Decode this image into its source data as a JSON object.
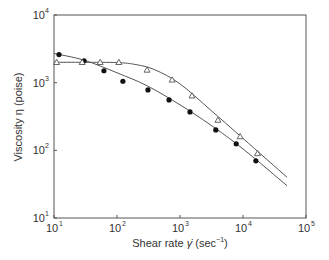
{
  "chart_data": {
    "type": "scatter",
    "title": "",
    "xlabel": "Shear rate γ̇ (sec⁻¹)",
    "ylabel": "Viscosity η (poise)",
    "xscale": "log",
    "yscale": "log",
    "xlim": [
      10,
      100000
    ],
    "ylim": [
      10,
      10000
    ],
    "x_ticks": [
      "10^1",
      "10^2",
      "10^3",
      "10^4",
      "10^5"
    ],
    "y_ticks": [
      "10^1",
      "10^2",
      "10^3",
      "10^4"
    ],
    "grid": false,
    "legend": null,
    "series": [
      {
        "name": "filled circles",
        "marker": "filled-circle",
        "x": [
          12,
          30,
          62,
          124,
          310,
          670,
          1440,
          3700,
          7800,
          16000
        ],
        "y": [
          2600,
          2100,
          1500,
          1050,
          780,
          555,
          370,
          200,
          125,
          70
        ],
        "fit_curve": {
          "x": [
            10,
            30,
            100,
            300,
            1000,
            3000,
            10000,
            50000
          ],
          "y": [
            2700,
            2150,
            1400,
            900,
            470,
            240,
            105,
            30
          ]
        }
      },
      {
        "name": "open triangles",
        "marker": "open-triangle",
        "x": [
          11,
          28,
          54,
          107,
          300,
          750,
          1550,
          4000,
          9000,
          17000
        ],
        "y": [
          2000,
          2000,
          2000,
          2000,
          1540,
          1100,
          640,
          280,
          160,
          90
        ],
        "fit_curve": {
          "x": [
            10,
            30,
            100,
            200,
            400,
            1000,
            3000,
            10000,
            50000
          ],
          "y": [
            2000,
            2000,
            1980,
            1850,
            1550,
            960,
            400,
            150,
            40
          ]
        }
      }
    ]
  },
  "labels": {
    "ylabel_text": "Viscosity η (poise)",
    "xlabel_prefix": "Shear rate ",
    "xlabel_gamma": "γ̇",
    "xlabel_unit": " (sec",
    "xlabel_exp": "−1",
    "xlabel_close": ")"
  }
}
